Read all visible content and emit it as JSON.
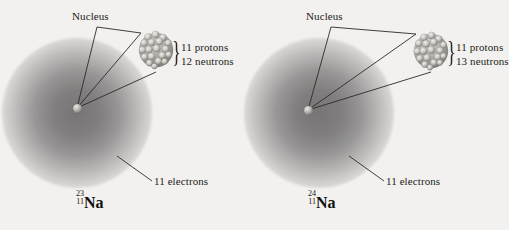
{
  "figure": {
    "background_color": "#f2f1ef",
    "ink_color": "#1d1c1b",
    "atoms": [
      {
        "id": "sodium-23",
        "nucleus_label": "Nucleus",
        "protons_label": "11 protons",
        "neutrons_label": "12 neutrons",
        "electrons_label": "11 electrons",
        "brace_glyph": "}",
        "isotope": {
          "mass_number": "23",
          "atomic_number": "11",
          "symbol": "Na"
        }
      },
      {
        "id": "sodium-24",
        "nucleus_label": "Nucleus",
        "protons_label": "11 protons",
        "neutrons_label": "13 neutrons",
        "electrons_label": "11 electrons",
        "brace_glyph": "}",
        "isotope": {
          "mass_number": "24",
          "atomic_number": "11",
          "symbol": "Na"
        }
      }
    ]
  }
}
